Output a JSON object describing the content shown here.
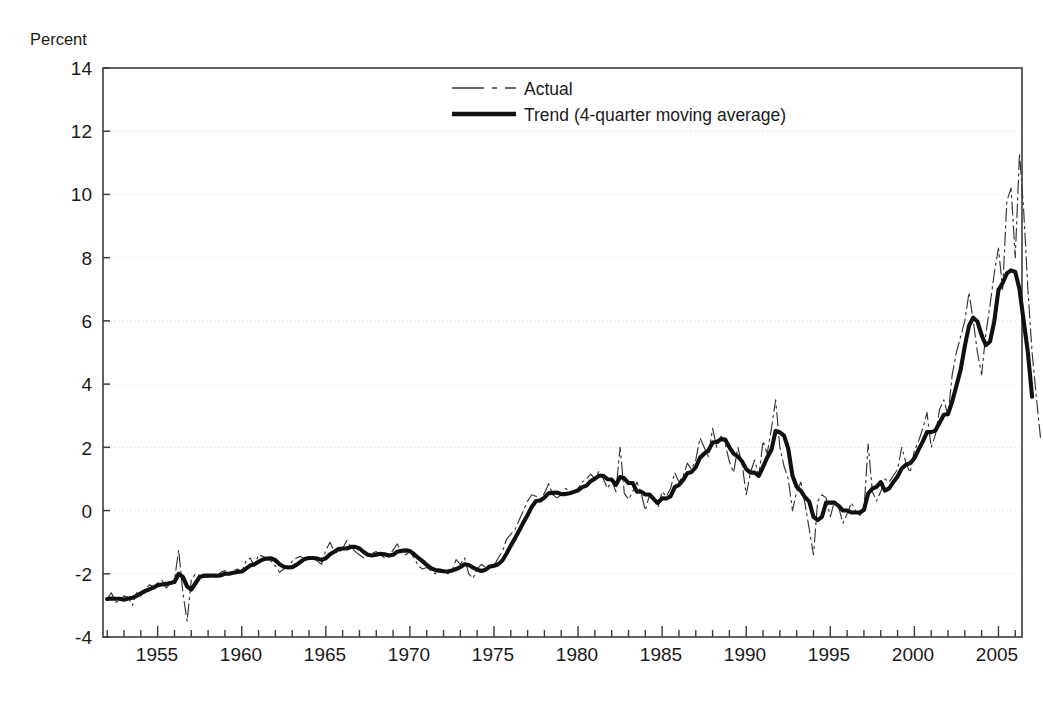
{
  "chart_data": {
    "type": "line",
    "title": "",
    "subtitle": "",
    "ylabel": "Percent",
    "xlabel": "",
    "ylim": [
      -4,
      14
    ],
    "xlim": [
      1951.75,
      2006.4
    ],
    "yticks": [
      -4,
      -2,
      0,
      2,
      4,
      6,
      8,
      10,
      12,
      14
    ],
    "ytick_labels": [
      "-4",
      "-2",
      "0",
      "2",
      "4",
      "6",
      "8",
      "10",
      "12",
      "14"
    ],
    "xticks": [
      1955,
      1960,
      1965,
      1970,
      1975,
      1980,
      1985,
      1990,
      1995,
      2000,
      2005
    ],
    "xtick_labels": [
      "1955",
      "1960",
      "1965",
      "1970",
      "1975",
      "1980",
      "1985",
      "1990",
      "1995",
      "2000",
      "2005"
    ],
    "x_minor_tick_interval": 1,
    "grid": "horizontal-dotted-light",
    "legend_position": "top-center",
    "legend": [
      {
        "label": "Actual",
        "style": "thin dash-dot",
        "color": "#333333",
        "width": 1.1
      },
      {
        "label": "Trend (4-quarter moving average)",
        "style": "thick solid",
        "color": "#111111",
        "width": 4.0
      }
    ],
    "series": [
      {
        "name": "Actual",
        "x_start": 1952.0,
        "x_step": 0.25,
        "values": [
          -2.8,
          -2.6,
          -2.9,
          -2.85,
          -2.7,
          -2.75,
          -3.0,
          -2.6,
          -2.7,
          -2.5,
          -2.35,
          -2.4,
          -2.3,
          -2.2,
          -2.45,
          -2.3,
          -2.2,
          -1.25,
          -2.6,
          -3.5,
          -2.2,
          -2.0,
          -2.05,
          -2.1,
          -2.1,
          -2.0,
          -2.15,
          -1.95,
          -1.9,
          -2.05,
          -1.9,
          -1.85,
          -1.95,
          -1.6,
          -1.5,
          -1.75,
          -1.4,
          -1.45,
          -1.5,
          -1.6,
          -1.75,
          -1.95,
          -1.85,
          -1.8,
          -1.6,
          -1.5,
          -1.45,
          -1.55,
          -1.45,
          -1.5,
          -1.6,
          -1.7,
          -1.25,
          -1.0,
          -1.3,
          -1.35,
          -1.2,
          -0.95,
          -1.15,
          -1.3,
          -1.4,
          -1.5,
          -1.45,
          -1.35,
          -1.3,
          -1.4,
          -1.5,
          -1.45,
          -1.25,
          -1.05,
          -1.35,
          -1.4,
          -1.3,
          -1.5,
          -1.75,
          -1.85,
          -1.8,
          -1.9,
          -2.0,
          -1.85,
          -1.9,
          -2.0,
          -1.9,
          -1.55,
          -1.7,
          -1.5,
          -2.0,
          -2.15,
          -1.85,
          -1.7,
          -1.8,
          -1.75,
          -1.75,
          -1.5,
          -1.3,
          -0.9,
          -0.75,
          -0.6,
          -0.3,
          0.0,
          0.3,
          0.5,
          0.45,
          0.35,
          0.55,
          0.85,
          0.5,
          0.4,
          0.5,
          0.7,
          0.6,
          0.55,
          0.7,
          0.9,
          1.0,
          1.15,
          1.0,
          1.25,
          1.0,
          0.7,
          0.95,
          0.6,
          2.0,
          0.55,
          0.35,
          0.6,
          0.9,
          0.55,
          0.0,
          0.5,
          0.35,
          0.1,
          0.6,
          0.45,
          0.7,
          1.2,
          0.9,
          1.1,
          1.5,
          1.3,
          1.6,
          2.3,
          2.0,
          1.7,
          2.6,
          2.0,
          2.35,
          2.1,
          1.55,
          1.2,
          2.0,
          1.5,
          0.5,
          1.2,
          1.6,
          1.1,
          2.2,
          1.8,
          2.6,
          3.5,
          2.0,
          1.4,
          1.0,
          0.0,
          0.6,
          0.9,
          0.2,
          -0.6,
          -1.4,
          0.3,
          0.5,
          0.4,
          -0.2,
          0.3,
          0.1,
          -0.4,
          -0.1,
          0.25,
          0.0,
          -0.15,
          0.0,
          2.1,
          0.6,
          0.3,
          0.6,
          1.0,
          0.9,
          1.1,
          1.3,
          2.0,
          1.5,
          1.2,
          1.9,
          2.2,
          2.6,
          3.1,
          2.0,
          2.4,
          3.2,
          3.5,
          3.0,
          4.3,
          5.0,
          5.5,
          6.0,
          6.9,
          6.0,
          5.0,
          4.3,
          5.6,
          6.5,
          7.5,
          8.3,
          7.0,
          9.8,
          10.2,
          8.0,
          11.3,
          9.5,
          7.0,
          5.0,
          3.6,
          2.3
        ]
      },
      {
        "name": "Trend (4-quarter moving average)",
        "x_start": 1952.0,
        "x_step": 0.25,
        "values": [
          -2.8,
          -2.78,
          -2.79,
          -2.79,
          -2.82,
          -2.78,
          -2.76,
          -2.7,
          -2.62,
          -2.55,
          -2.49,
          -2.44,
          -2.36,
          -2.34,
          -2.32,
          -2.29,
          -2.26,
          -2.0,
          -2.1,
          -2.4,
          -2.5,
          -2.3,
          -2.1,
          -2.06,
          -2.06,
          -2.06,
          -2.06,
          -2.05,
          -2.0,
          -2.0,
          -1.97,
          -1.94,
          -1.93,
          -1.84,
          -1.74,
          -1.7,
          -1.62,
          -1.55,
          -1.52,
          -1.51,
          -1.57,
          -1.7,
          -1.78,
          -1.8,
          -1.79,
          -1.72,
          -1.62,
          -1.53,
          -1.5,
          -1.5,
          -1.52,
          -1.56,
          -1.51,
          -1.38,
          -1.3,
          -1.22,
          -1.2,
          -1.2,
          -1.15,
          -1.15,
          -1.2,
          -1.31,
          -1.4,
          -1.42,
          -1.4,
          -1.37,
          -1.38,
          -1.42,
          -1.4,
          -1.3,
          -1.27,
          -1.26,
          -1.28,
          -1.38,
          -1.5,
          -1.6,
          -1.72,
          -1.82,
          -1.88,
          -1.9,
          -1.92,
          -1.93,
          -1.9,
          -1.85,
          -1.79,
          -1.7,
          -1.72,
          -1.8,
          -1.87,
          -1.91,
          -1.87,
          -1.77,
          -1.75,
          -1.7,
          -1.58,
          -1.36,
          -1.11,
          -0.88,
          -0.63,
          -0.38,
          -0.14,
          0.12,
          0.3,
          0.32,
          0.41,
          0.55,
          0.56,
          0.57,
          0.52,
          0.52,
          0.55,
          0.59,
          0.64,
          0.74,
          0.79,
          0.93,
          1.01,
          1.1,
          1.1,
          0.99,
          0.98,
          0.81,
          1.06,
          1.02,
          0.87,
          0.87,
          0.6,
          0.6,
          0.51,
          0.51,
          0.36,
          0.24,
          0.39,
          0.38,
          0.45,
          0.74,
          0.81,
          0.97,
          1.18,
          1.22,
          1.37,
          1.67,
          1.8,
          1.9,
          2.15,
          2.17,
          2.26,
          2.25,
          2.0,
          1.8,
          1.71,
          1.56,
          1.31,
          1.2,
          1.2,
          1.1,
          1.38,
          1.68,
          1.92,
          2.52,
          2.47,
          2.37,
          1.95,
          1.1,
          0.75,
          0.62,
          0.42,
          0.28,
          -0.2,
          -0.3,
          -0.2,
          0.25,
          0.25,
          0.25,
          0.15,
          0.0,
          0.0,
          -0.06,
          -0.06,
          -0.06,
          0.02,
          0.54,
          0.69,
          0.75,
          0.9,
          0.63,
          0.7,
          0.9,
          1.08,
          1.33,
          1.45,
          1.5,
          1.65,
          1.93,
          2.18,
          2.48,
          2.48,
          2.53,
          2.78,
          3.03,
          3.05,
          3.45,
          3.95,
          4.45,
          5.2,
          5.85,
          6.1,
          5.98,
          5.55,
          5.23,
          5.35,
          5.98,
          6.98,
          7.2,
          7.5,
          7.6,
          7.55,
          7.0,
          6.0,
          5.0,
          3.6
        ]
      }
    ]
  },
  "plot": {
    "left_px": 103,
    "right_px": 1022,
    "top_px": 68,
    "bottom_px": 637,
    "frame_color": "#3b3b3b",
    "gridline_color": "#d9d9d9",
    "background": "#ffffff"
  },
  "legend_box": {
    "actual_swatch_x": 452,
    "actual_swatch_y": 88,
    "trend_swatch_x": 452,
    "trend_swatch_y": 114,
    "text_x": 524
  }
}
